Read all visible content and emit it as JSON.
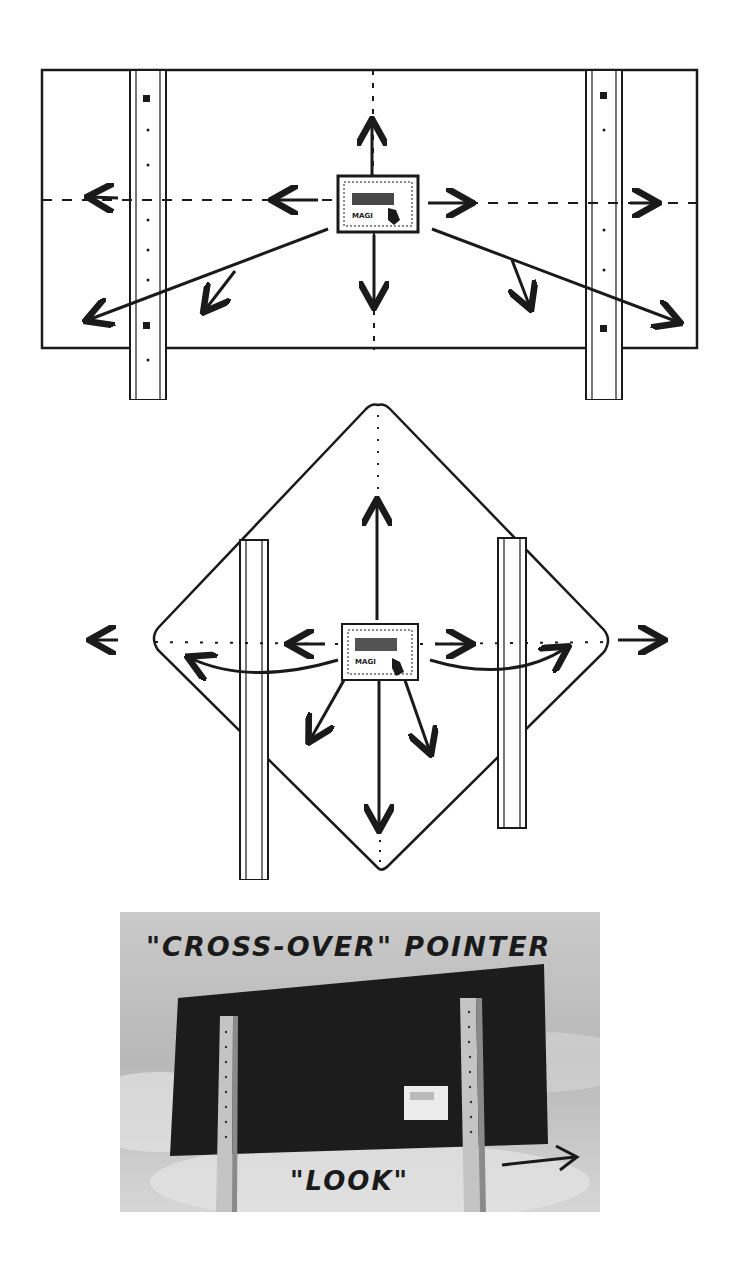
{
  "figure": {
    "panels": [
      {
        "id": "rectangular-sign",
        "description": "Rectangular sign on two posts with a small decal in the center; arrows radiate from decal",
        "decal_text": "MAGI"
      },
      {
        "id": "diamond-sign",
        "description": "Diamond sign on two posts with a small decal in the center; arrows radiate including curved arrows to corners",
        "decal_text": "MAGI"
      },
      {
        "id": "photo",
        "description": "Photograph of a dark rectangular sign on two perforated posts with a small white decal",
        "caption_top": "\"CROSS-OVER\" POINTER",
        "caption_bottom": "\"LOOK\"",
        "arrow": "right-arrow"
      }
    ]
  },
  "colors": {
    "ink": "#1a1a1a",
    "paper": "#ffffff",
    "sign_dark": "#1c1c1c",
    "sky": "#bdbdbd",
    "post": "#c8c8c8"
  }
}
